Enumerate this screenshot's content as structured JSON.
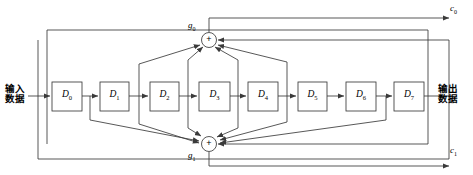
{
  "diagram": {
    "type": "convolutional-encoder-block-diagram",
    "title": "",
    "stroke_color": "#3a3a3a",
    "text_color": "#000000",
    "background_color": "#ffffff",
    "input_label": {
      "line1": "输入",
      "line2": "数据"
    },
    "output_label": {
      "line1": "输出",
      "line2": "数据"
    },
    "registers": [
      {
        "id": "D0",
        "base": "D",
        "sub": "0",
        "x": 52,
        "y": 82,
        "w": 30,
        "h": 29
      },
      {
        "id": "D1",
        "base": "D",
        "sub": "1",
        "x": 100,
        "y": 82,
        "w": 29,
        "h": 29
      },
      {
        "id": "D2",
        "base": "D",
        "sub": "2",
        "x": 150,
        "y": 82,
        "w": 29,
        "h": 29
      },
      {
        "id": "D3",
        "base": "D",
        "sub": "3",
        "x": 199,
        "y": 82,
        "w": 31,
        "h": 29
      },
      {
        "id": "D4",
        "base": "D",
        "sub": "4",
        "x": 248,
        "y": 82,
        "w": 30,
        "h": 29
      },
      {
        "id": "D5",
        "base": "D",
        "sub": "5",
        "x": 298,
        "y": 82,
        "w": 29,
        "h": 29
      },
      {
        "id": "D6",
        "base": "D",
        "sub": "6",
        "x": 346,
        "y": 82,
        "w": 30,
        "h": 29
      },
      {
        "id": "D7",
        "base": "D",
        "sub": "7",
        "x": 394,
        "y": 82,
        "w": 30,
        "h": 29
      }
    ],
    "adders": [
      {
        "id": "g0",
        "base": "g",
        "sub": "0",
        "symbol": "+",
        "cx": 209,
        "cy": 40,
        "r": 7.5,
        "label_x": 190,
        "label_y": 25
      },
      {
        "id": "g1",
        "base": "g",
        "sub": "1",
        "symbol": "+",
        "cx": 209,
        "cy": 144,
        "r": 7.5,
        "label_x": 190,
        "label_y": 150
      }
    ],
    "outputs": [
      {
        "id": "c0",
        "base": "c",
        "sub": "0",
        "x": 449,
        "y": 5
      },
      {
        "id": "c1",
        "base": "c",
        "sub": "1",
        "x": 449,
        "y": 143
      }
    ]
  }
}
